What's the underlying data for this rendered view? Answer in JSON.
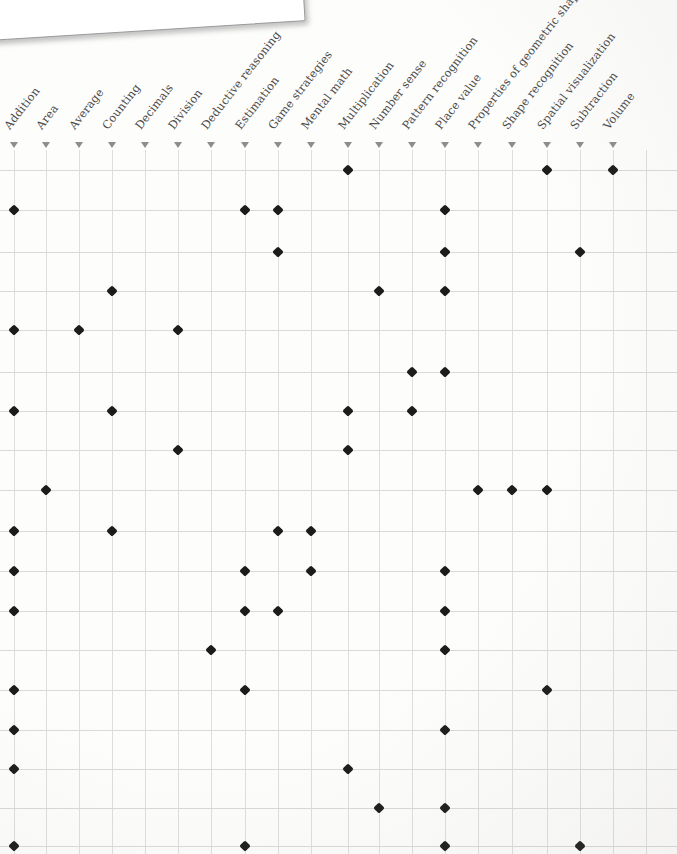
{
  "callout": {
    "text": "to your curriculum."
  },
  "matrix": {
    "columns": [
      "Addition",
      "Area",
      "Average",
      "Counting",
      "Decimals",
      "Division",
      "Deductive reasoning",
      "Estimation",
      "Game strategies",
      "Mental math",
      "Multiplication",
      "Number sense",
      "Pattern recognition",
      "Place value",
      "Properties of geometric shapes",
      "Shape recognition",
      "Spatial visualization",
      "Subtraction",
      "Volume"
    ],
    "column_x": [
      14,
      46,
      79,
      112,
      145,
      178,
      211,
      245,
      278,
      311,
      348,
      379,
      412,
      445,
      478,
      512,
      547,
      580,
      613
    ],
    "row_y": [
      170,
      210,
      252,
      291,
      330,
      372,
      411,
      450,
      490,
      531,
      571,
      611,
      650,
      690,
      730,
      769,
      808,
      846
    ],
    "marker": "diamond",
    "marker_color": "#1c1c1c",
    "grid_color": "#dcdcdc",
    "label_color": "#4a4a4a",
    "triangle_color": "#8d8d8d",
    "cells": [
      {
        "row": 0,
        "cols": [
          10,
          16,
          18
        ]
      },
      {
        "row": 1,
        "cols": [
          0,
          7,
          8,
          13
        ]
      },
      {
        "row": 2,
        "cols": [
          8,
          13,
          17
        ]
      },
      {
        "row": 3,
        "cols": [
          3,
          11,
          13
        ]
      },
      {
        "row": 4,
        "cols": [
          0,
          2,
          5
        ]
      },
      {
        "row": 5,
        "cols": [
          12,
          13
        ]
      },
      {
        "row": 6,
        "cols": [
          0,
          3,
          10,
          12
        ]
      },
      {
        "row": 7,
        "cols": [
          5,
          10
        ]
      },
      {
        "row": 8,
        "cols": [
          1,
          14,
          15,
          16
        ]
      },
      {
        "row": 9,
        "cols": [
          0,
          3,
          8,
          9
        ]
      },
      {
        "row": 10,
        "cols": [
          0,
          7,
          9,
          13
        ]
      },
      {
        "row": 11,
        "cols": [
          0,
          7,
          8,
          13
        ]
      },
      {
        "row": 12,
        "cols": [
          6,
          13
        ]
      },
      {
        "row": 13,
        "cols": [
          0,
          7,
          16
        ]
      },
      {
        "row": 14,
        "cols": [
          0,
          13
        ]
      },
      {
        "row": 15,
        "cols": [
          0,
          10
        ]
      },
      {
        "row": 16,
        "cols": [
          11,
          13
        ]
      },
      {
        "row": 17,
        "cols": [
          0,
          7,
          13,
          17
        ]
      }
    ]
  }
}
